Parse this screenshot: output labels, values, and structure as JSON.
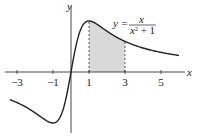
{
  "chart_data": {
    "type": "line",
    "title": "",
    "function": "y = x / (x^2 + 1)",
    "xlabel": "x",
    "ylabel": "y",
    "xticks": [
      "-3",
      "-1",
      "1",
      "3",
      "5"
    ],
    "xlim": [
      -3.5,
      6
    ],
    "ylim": [
      -0.55,
      0.65
    ],
    "shaded_region": {
      "from": 1,
      "to": 3,
      "color": "#d9d9d9"
    },
    "series": [
      {
        "name": "y = x/(x^2+1)",
        "x": [
          -3,
          -2,
          -1,
          -0.5,
          0,
          0.5,
          1,
          2,
          3,
          4,
          5,
          6
        ],
        "values": [
          -0.3,
          -0.4,
          -0.5,
          -0.4,
          0,
          0.4,
          0.5,
          0.4,
          0.3,
          0.235,
          0.192,
          0.162
        ]
      }
    ],
    "annotations": [
      {
        "text": "y = x / (x² + 1)",
        "x": 3.2,
        "y": 0.55
      }
    ],
    "grid": false
  },
  "labels": {
    "x_axis": "x",
    "y_axis": "y",
    "eq_lhs": "y =",
    "eq_num": "x",
    "eq_den": "x",
    "eq_den_exp": "2",
    "eq_den_rest": " + 1",
    "ticks": [
      "−3",
      "−1",
      "1",
      "3",
      "5"
    ]
  }
}
